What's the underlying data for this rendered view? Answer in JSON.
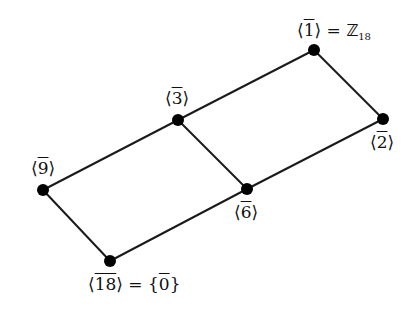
{
  "diagram": {
    "colors": {
      "edge": "#1a1a1a",
      "node": "#000000",
      "background": "#ffffff"
    },
    "nodes": [
      {
        "id": "n1",
        "x": 314,
        "y": 50,
        "gen": "1",
        "suffix_eq": "=",
        "suffix_sym": "Z",
        "suffix_sub": "18"
      },
      {
        "id": "n3",
        "x": 178,
        "y": 120,
        "gen": "3"
      },
      {
        "id": "n2",
        "x": 383,
        "y": 119,
        "gen": "2"
      },
      {
        "id": "n9",
        "x": 43,
        "y": 190,
        "gen": "9"
      },
      {
        "id": "n6",
        "x": 247,
        "y": 189,
        "gen": "6"
      },
      {
        "id": "n18",
        "x": 110,
        "y": 261,
        "gen": "18",
        "suffix_eq": "=",
        "suffix_set": "0"
      }
    ],
    "edges": [
      [
        "n1",
        "n3"
      ],
      [
        "n1",
        "n2"
      ],
      [
        "n3",
        "n9"
      ],
      [
        "n3",
        "n6"
      ],
      [
        "n2",
        "n6"
      ],
      [
        "n9",
        "n18"
      ],
      [
        "n6",
        "n18"
      ]
    ],
    "labels": {
      "n1": {
        "left": "⟨",
        "gen": "1",
        "right": "⟩",
        "eq": "=",
        "sym": "ℤ",
        "sub": "18"
      },
      "n3": {
        "left": "⟨",
        "gen": "3",
        "right": "⟩"
      },
      "n2": {
        "left": "⟨",
        "gen": "2",
        "right": "⟩"
      },
      "n9": {
        "left": "⟨",
        "gen": "9",
        "right": "⟩"
      },
      "n6": {
        "left": "⟨",
        "gen": "6",
        "right": "⟩"
      },
      "n18": {
        "left": "⟨",
        "gen": "18",
        "right": "⟩",
        "eq": "=",
        "lbrace": "{",
        "setval": "0",
        "rbrace": "}"
      }
    }
  }
}
